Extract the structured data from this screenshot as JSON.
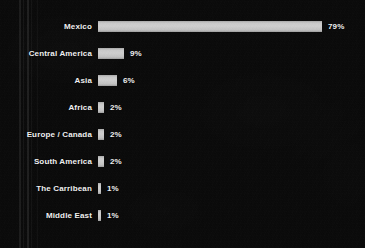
{
  "chart_data": {
    "type": "bar",
    "orientation": "horizontal",
    "title": "",
    "subtitle": "",
    "xlabel": "",
    "ylabel": "",
    "grid": false,
    "legend": false,
    "xlim": [
      0,
      100
    ],
    "value_suffix": "%",
    "categories": [
      "Mexico",
      "Central America",
      "Asia",
      "Africa",
      "Europe / Canada",
      "South America",
      "The Carribean",
      "Middle East"
    ],
    "values": [
      79,
      9,
      6,
      2,
      2,
      2,
      1,
      1
    ],
    "data_labels": [
      "79%",
      "9%",
      "6%",
      "2%",
      "2%",
      "2%",
      "1%",
      "1%"
    ],
    "bars": [
      {
        "label": "Mexico",
        "value": 79,
        "data_label": "79%"
      },
      {
        "label": "Central America",
        "value": 9,
        "data_label": "9%"
      },
      {
        "label": "Asia",
        "value": 6,
        "data_label": "6%"
      },
      {
        "label": "Africa",
        "value": 2,
        "data_label": "2%"
      },
      {
        "label": "Europe / Canada",
        "value": 2,
        "data_label": "2%"
      },
      {
        "label": "South America",
        "value": 2,
        "data_label": "2%"
      },
      {
        "label": "The Carribean",
        "value": 1,
        "data_label": "1%"
      },
      {
        "label": "Middle East",
        "value": 1,
        "data_label": "1%"
      }
    ]
  },
  "colors": {
    "background": "#090909",
    "bar": "#c9c9c9",
    "bar_edge": "#9d9d9d",
    "text": "#f2f2f2"
  }
}
